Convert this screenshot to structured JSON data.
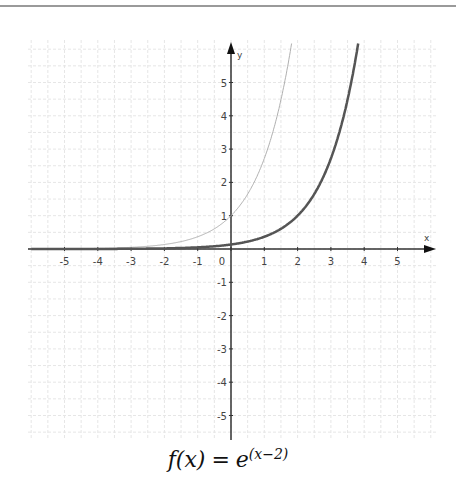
{
  "chart_data": {
    "type": "line",
    "title": "",
    "caption": {
      "lhs": "f(x)",
      "equals": "=",
      "base": "e",
      "exponent": "(x−2)"
    },
    "xlabel": "x",
    "ylabel": "y",
    "xlim": [
      -6,
      6
    ],
    "ylim": [
      -5.7,
      6.2
    ],
    "x_ticks": [
      -5,
      -4,
      -3,
      -2,
      -1,
      0,
      1,
      2,
      3,
      4,
      5
    ],
    "y_ticks": [
      -5,
      -4,
      -3,
      -2,
      -1,
      1,
      2,
      3,
      4,
      5
    ],
    "grid": true,
    "legend": "none",
    "series": [
      {
        "name": "e^x",
        "style": "thin light gray",
        "color": "#b0b0b0",
        "x": [
          -6,
          -5,
          -4,
          -3,
          -2,
          -1,
          0,
          0.5,
          1,
          1.5,
          1.8
        ],
        "values": [
          0.002,
          0.007,
          0.018,
          0.05,
          0.135,
          0.368,
          1.0,
          1.649,
          2.718,
          4.482,
          6.05
        ]
      },
      {
        "name": "e^(x-2)",
        "style": "thick dark gray",
        "color": "#555555",
        "x": [
          -6,
          -5,
          -4,
          -3,
          -2,
          -1,
          0,
          1,
          2,
          3,
          3.5,
          3.8
        ],
        "values": [
          0.0003,
          0.0009,
          0.0025,
          0.0067,
          0.018,
          0.05,
          0.135,
          0.368,
          1.0,
          2.718,
          4.482,
          6.05
        ]
      }
    ]
  },
  "colors": {
    "axis": "#333333",
    "grid": "#e6e6e6",
    "tick_label": "#444444",
    "curve_light": "#b0b0b0",
    "curve_dark": "#555555"
  }
}
